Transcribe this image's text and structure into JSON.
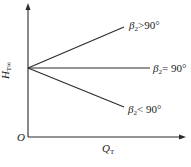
{
  "diagram": {
    "type": "line-characteristic",
    "axes": {
      "origin_label": "O",
      "x_label_main": "Q",
      "x_label_sub": "T",
      "y_label_main": "H",
      "y_label_sub": "T∞"
    },
    "curves": [
      {
        "id": "beta-gt-90",
        "label_main": "β",
        "label_sub": "2",
        "label_rest": ">90°",
        "trend": "increasing"
      },
      {
        "id": "beta-eq-90",
        "label_main": "β",
        "label_sub": "2",
        "label_rest": "= 90°",
        "trend": "constant"
      },
      {
        "id": "beta-lt-90",
        "label_main": "β",
        "label_sub": "2",
        "label_rest": "< 90°",
        "trend": "decreasing"
      }
    ],
    "colors": {
      "line": "#2a2a2a",
      "text": "#1a1a1a"
    }
  }
}
